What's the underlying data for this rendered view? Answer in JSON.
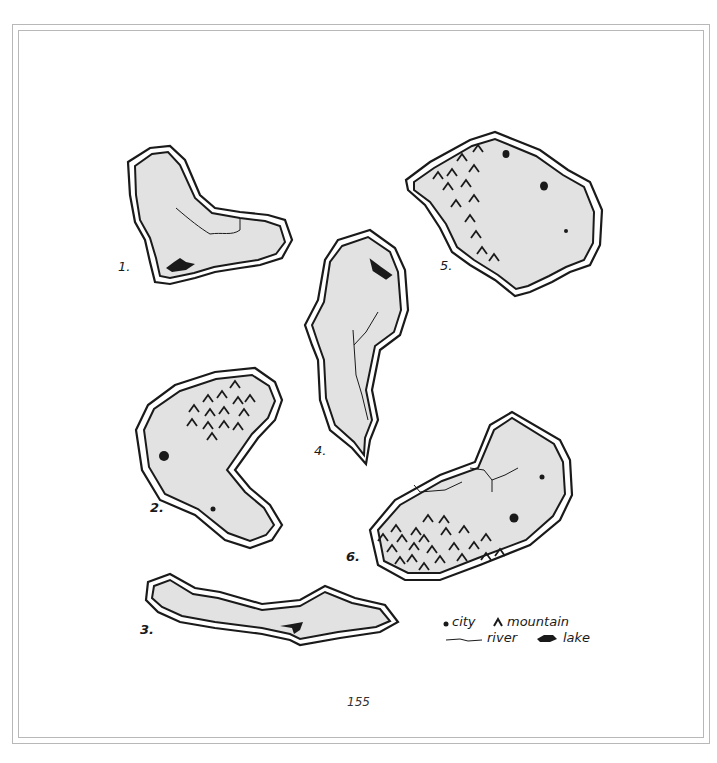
{
  "page": {
    "number": "155"
  },
  "colors": {
    "land": "#e2e2e2",
    "outline": "#1a1a1a",
    "frame": "#b8b8b8",
    "background": "#ffffff"
  },
  "islands": [
    {
      "label": "1.",
      "features": {
        "cities": 0,
        "mountains": 0,
        "rivers": 1,
        "lakes": 1
      }
    },
    {
      "label": "2.",
      "features": {
        "cities": 2,
        "mountains": 15,
        "rivers": 0,
        "lakes": 0
      }
    },
    {
      "label": "3.",
      "features": {
        "cities": 0,
        "mountains": 0,
        "rivers": 0,
        "lakes": 1
      }
    },
    {
      "label": "4.",
      "features": {
        "cities": 0,
        "mountains": 0,
        "rivers": 1,
        "lakes": 1
      }
    },
    {
      "label": "5.",
      "features": {
        "cities": 3,
        "mountains": 14,
        "rivers": 0,
        "lakes": 0
      }
    },
    {
      "label": "6.",
      "features": {
        "cities": 2,
        "mountains": 24,
        "rivers": 2,
        "lakes": 0
      }
    }
  ],
  "legend": {
    "items": [
      {
        "icon": "city-dot-icon",
        "label": "city"
      },
      {
        "icon": "mountain-caret-icon",
        "label": "mountain"
      },
      {
        "icon": "river-line-icon",
        "label": "river"
      },
      {
        "icon": "lake-blob-icon",
        "label": "lake"
      }
    ]
  }
}
